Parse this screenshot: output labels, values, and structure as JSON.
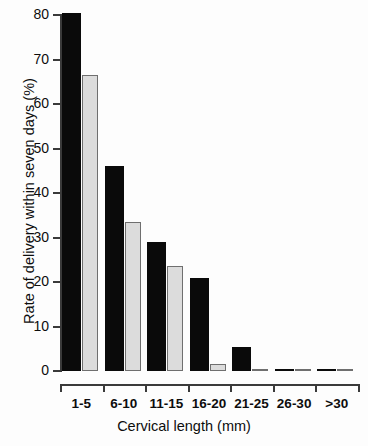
{
  "chart_data": {
    "type": "bar",
    "title": "",
    "subtitle": "",
    "xlabel": "Cervical length (mm)",
    "ylabel": "Rate of delivery within seven days (%)",
    "categories": [
      "1-5",
      "6-10",
      "11-15",
      "16-20",
      "21-25",
      "26-30",
      ">30"
    ],
    "series": [
      {
        "name": "black-series",
        "color": "#0a0a0a",
        "values": [
          80.5,
          46.0,
          29.0,
          21.0,
          5.5,
          0,
          0
        ]
      },
      {
        "name": "gray-series",
        "color": "#dcdcdc",
        "values": [
          66.5,
          33.5,
          23.5,
          1.5,
          0,
          0,
          0
        ]
      }
    ],
    "ylim": [
      0,
      80
    ],
    "yticks": [
      0,
      10,
      20,
      30,
      40,
      50,
      60,
      70,
      80
    ],
    "ytick_labels": [
      "0",
      "10",
      "20",
      "30",
      "40",
      "50",
      "60",
      "70",
      "80"
    ],
    "grid": false,
    "legend": "none",
    "axis_color": "#3a3a3a"
  }
}
